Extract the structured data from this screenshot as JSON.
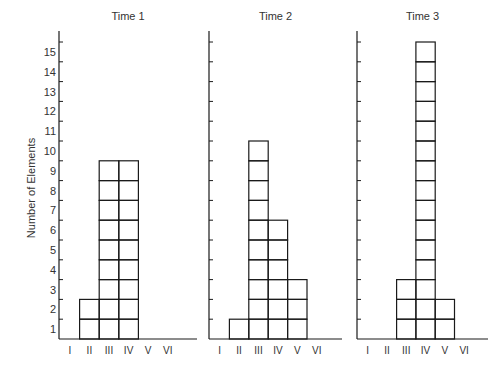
{
  "chart_data": {
    "type": "bar",
    "title": "",
    "xlabel": "",
    "ylabel": "Number of Elements",
    "ylim": [
      0,
      15
    ],
    "yticks": [
      1,
      2,
      3,
      4,
      5,
      6,
      7,
      8,
      9,
      10,
      11,
      12,
      13,
      14,
      15
    ],
    "categories": [
      "I",
      "II",
      "III",
      "IV",
      "V",
      "VI"
    ],
    "grid": false,
    "style": "stacked unit squares (each element drawn as one box)",
    "panels": [
      {
        "title": "Time 1",
        "values": [
          0,
          2,
          9,
          9,
          0,
          0
        ]
      },
      {
        "title": "Time 2",
        "values": [
          0,
          1,
          10,
          6,
          3,
          0
        ]
      },
      {
        "title": "Time 3",
        "values": [
          0,
          0,
          3,
          15,
          2,
          0
        ]
      }
    ]
  },
  "colors": {
    "line": "#1a1a1a",
    "text": "#333333",
    "background": "#ffffff"
  }
}
